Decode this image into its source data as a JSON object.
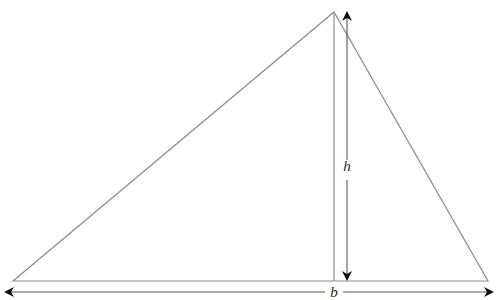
{
  "diagram": {
    "type": "triangle-area-figure",
    "colors": {
      "triangle_stroke": "#8c8c8c",
      "altitude_stroke": "#8c8c8c",
      "arrow_stroke": "#555555",
      "arrowhead_fill": "#111111",
      "label_fill": "#222222",
      "background": "#ffffff"
    },
    "triangle": {
      "vertices": {
        "left": [
          13,
          281
        ],
        "apex": [
          334,
          12
        ],
        "right": [
          488,
          281
        ]
      }
    },
    "altitude": {
      "x": 334,
      "y_top": 12,
      "y_bottom": 281
    },
    "height_arrow": {
      "x": 347,
      "y_top": 11,
      "y_bottom": 281,
      "label": "h",
      "label_pos": [
        347,
        171
      ]
    },
    "base_arrow": {
      "y": 292,
      "x_left": 4,
      "x_right": 494,
      "label": "b",
      "label_pos": [
        334,
        297
      ]
    }
  }
}
